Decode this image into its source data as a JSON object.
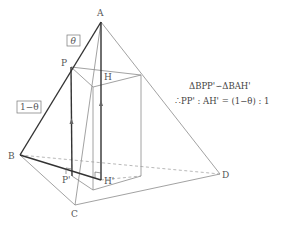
{
  "diagram": {
    "type": "3d-geometry",
    "points": {
      "A": {
        "label": "A",
        "x": 101,
        "y": 22
      },
      "B": {
        "label": "B",
        "x": 20,
        "y": 155
      },
      "C": {
        "label": "C",
        "x": 75,
        "y": 205
      },
      "D": {
        "label": "D",
        "x": 220,
        "y": 174
      },
      "P": {
        "label": "P",
        "x": 71,
        "y": 67
      },
      "H": {
        "label": "H",
        "x": 101,
        "y": 87
      },
      "P_prime": {
        "label": "P'",
        "x": 72,
        "y": 176
      },
      "H_prime": {
        "label": "H'",
        "x": 101,
        "y": 180
      }
    },
    "ratio_labels": {
      "upper": "θ",
      "lower": "1−θ"
    },
    "equations": {
      "line1": "ΔBPP'∽ΔBAH'",
      "line2": "∴PP' : AH' = (1−θ) : 1"
    },
    "colors": {
      "thick_line": "#333333",
      "thin_line": "#888888",
      "dashed_line": "#999999",
      "label": "#555555"
    }
  }
}
